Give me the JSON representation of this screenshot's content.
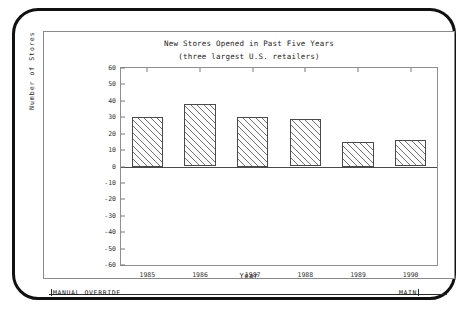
{
  "window": {
    "status_bar": {
      "left_label": "MANUAL OVERRIDE",
      "right_label": "MAIN"
    }
  },
  "chart_data": {
    "type": "bar",
    "title": "New Stores Opened in Past Five Years",
    "subtitle": "(three largest U.S. retailers)",
    "xlabel": "Year",
    "ylabel": "Number of Stores",
    "categories": [
      "1985",
      "1986",
      "1987",
      "1988",
      "1989",
      "1990"
    ],
    "values": [
      30,
      38,
      30,
      29,
      15,
      16
    ],
    "ylim": [
      -60,
      60
    ],
    "yticks": [
      60,
      50,
      40,
      30,
      20,
      10,
      0,
      -10,
      -20,
      -30,
      -40,
      -50,
      -60
    ],
    "ytick_labels": [
      "60",
      "50",
      "40",
      "30",
      "20",
      "10",
      "0",
      "-10",
      "-20",
      "-30",
      "-40",
      "-50",
      "-60"
    ],
    "grid": false,
    "legend": false,
    "bar_fill": "diagonal-hatch",
    "bar_edge_color": "#4a4a4a"
  }
}
